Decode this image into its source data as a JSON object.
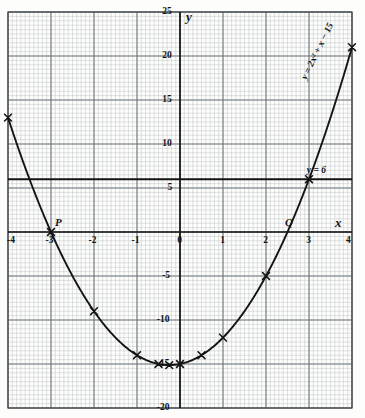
{
  "chart_data": {
    "type": "line",
    "title": "",
    "xlabel": "x",
    "ylabel": "y",
    "xlim": [
      -4,
      4
    ],
    "ylim": [
      -20,
      25
    ],
    "grid": true,
    "grid_minor_x_step": 0.1,
    "grid_minor_y_step": 0.5,
    "grid_major_x_step": 1,
    "grid_major_y_step": 5,
    "xticks": [
      "-4",
      "-3",
      "-2",
      "-1",
      "0",
      "1",
      "2",
      "3",
      "4"
    ],
    "xtick_values": [
      -4,
      -3,
      -2,
      -1,
      0,
      1,
      2,
      3,
      4
    ],
    "yticks": [
      "25",
      "20",
      "15",
      "10",
      "5",
      "-5",
      "-10",
      "-15",
      "-20"
    ],
    "ytick_values": [
      25,
      20,
      15,
      10,
      5,
      -5,
      -10,
      -15,
      -20
    ],
    "series": [
      {
        "name": "y = 2x² + x − 15",
        "label": "y = 2x² + x − 15",
        "kind": "parabola",
        "coefficients": {
          "a": 2,
          "b": 1,
          "c": -15
        },
        "x": [
          -4,
          -3,
          -2.5,
          -2,
          -1.5,
          -1,
          -0.5,
          -0.25,
          0,
          0.5,
          1,
          1.5,
          2,
          2.5,
          3,
          3.5,
          4
        ],
        "y": [
          13,
          0,
          -5,
          -9,
          -12,
          -14,
          -15,
          -15.125,
          -15,
          -14,
          -12,
          -9,
          -5,
          0,
          6,
          13,
          21
        ],
        "marked_points_x": [
          -4,
          -3,
          -2,
          -1,
          -0.5,
          -0.25,
          0,
          0.5,
          1,
          2,
          3,
          4
        ],
        "marked_points_y": [
          13,
          0,
          -9,
          -14,
          -15,
          -15.125,
          -15,
          -14,
          -12,
          -5,
          6,
          21
        ]
      },
      {
        "name": "y = 6",
        "label": "y = 6",
        "kind": "horizontal-line",
        "value": 6
      }
    ],
    "annotations": [
      {
        "text": "P",
        "x": -3,
        "y": 0,
        "note": "left root on x-axis"
      },
      {
        "text": "Q",
        "x": 2.5,
        "y": 0,
        "note": "right root on x-axis"
      }
    ]
  },
  "labels": {
    "axis_x": "x",
    "axis_y": "y",
    "curve_equation": "y = 2x² + x − 15",
    "line_equation": "y = 6",
    "point_p": "P",
    "point_q": "Q"
  },
  "colors": {
    "ink": "#141414",
    "grid_minor": "#b9bfc4",
    "grid_major": "#6d747a",
    "paper": "#fdfdfb"
  }
}
